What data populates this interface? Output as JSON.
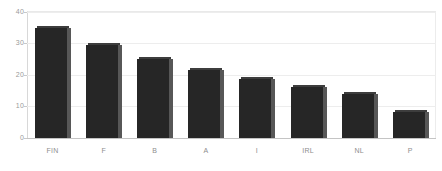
{
  "chart_data": {
    "type": "bar",
    "title": "",
    "xlabel": "",
    "ylabel": "",
    "categories": [
      "FIN",
      "F",
      "B",
      "A",
      "I",
      "IRL",
      "NL",
      "P"
    ],
    "values": [
      35,
      29.5,
      25,
      21.5,
      18.7,
      16.2,
      14,
      8.3
    ],
    "ylim": [
      0,
      40
    ],
    "yticks": [
      0,
      10,
      20,
      30,
      40
    ],
    "ytick_labels": [
      "0",
      "10",
      "20",
      "30",
      "40"
    ],
    "grid": true,
    "grid_axis": "y",
    "legend": false,
    "legend_position": "none",
    "bar_color": "#262626",
    "bar_side_color": "#575757",
    "gridline_color": "#ededed",
    "axis_color": "#c4c4c4",
    "tick_label_color": "#9a9a9a",
    "background": "#ffffff",
    "style": "3d-shaded-bars"
  }
}
